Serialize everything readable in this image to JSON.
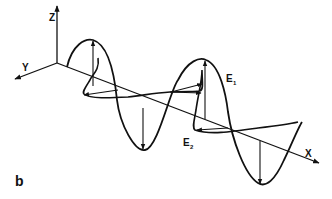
{
  "figure": {
    "panel_label": "b",
    "axes": {
      "x_label": "X",
      "y_label": "Y",
      "z_label": "Z"
    },
    "vectors": {
      "e1_label": "E",
      "e1_subscript": "1",
      "e2_label": "E",
      "e2_subscript": "2"
    },
    "colors": {
      "ink": "#111111",
      "background": "#ffffff"
    }
  }
}
